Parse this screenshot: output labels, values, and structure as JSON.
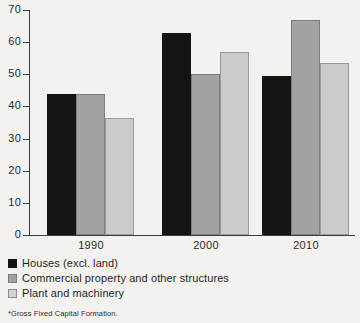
{
  "chart_data": {
    "type": "bar",
    "title": "",
    "subtitle": "",
    "xlabel": "",
    "ylabel": "",
    "ylim": [
      0,
      70
    ],
    "yticks": [
      0,
      10,
      20,
      30,
      40,
      50,
      60,
      70
    ],
    "grid": false,
    "legend_position": "below-left",
    "categories": [
      "1990",
      "2000",
      "2010"
    ],
    "series": [
      {
        "name": "Houses (excl. land)",
        "color": "#141414",
        "values": [
          44,
          63,
          49.5
        ]
      },
      {
        "name": "Commercial property and other structures",
        "color": "#a2a2a2",
        "values": [
          44,
          50,
          67
        ]
      },
      {
        "name": "Plant and machinery",
        "color": "#cbcbcb",
        "values": [
          36.5,
          57,
          53.5
        ]
      }
    ],
    "footnote": "*Gross Fixed Capital Formation."
  },
  "colors": {
    "background": "#f4f2ef",
    "axis": "#3d3d3d",
    "text": "#1f1f1f",
    "series_dark": "#141414",
    "series_mid": "#a2a2a2",
    "series_light": "#cbcbcb"
  }
}
